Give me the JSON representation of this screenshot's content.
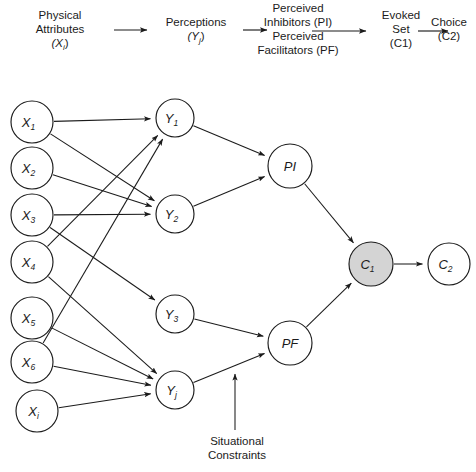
{
  "diagram": {
    "headers": [
      {
        "id": "physical-attributes",
        "line1": "Physical",
        "line2": "Attributes",
        "line3": "(X",
        "sub": "i",
        "line3_end": ")",
        "x": 12,
        "y": 8,
        "width": 96
      },
      {
        "id": "perceptions",
        "line1": "Perceptions",
        "line2": "(Y",
        "sub": "j",
        "line2_end": ")",
        "x": 152,
        "y": 15,
        "width": 88
      },
      {
        "id": "perceived-inhibitors-facilitators",
        "line1": "Perceived",
        "line2": "Inhibitors (PI)",
        "line3": "Perceived",
        "line4": "Facilitators (PF)",
        "x": 240,
        "y": 1,
        "width": 116
      },
      {
        "id": "evoked-set",
        "line1": "Evoked",
        "line2": "Set",
        "line3": "(C1)",
        "x": 372,
        "y": 8,
        "width": 58
      },
      {
        "id": "choice",
        "line1": "Choice",
        "line2": "(C2)",
        "x": 424,
        "y": 15,
        "width": 50
      }
    ],
    "header_arrows": [
      {
        "id": "arrow-attributes-to-perceptions",
        "x1": 114,
        "y1": 30,
        "x2": 147,
        "y2": 30
      },
      {
        "id": "arrow-perceptions-to-perceived",
        "x1": 243,
        "y1": 30,
        "x2": 267,
        "y2": 30
      },
      {
        "id": "arrow-perceived-to-evoked",
        "x1": 312,
        "y1": 31,
        "x2": 366,
        "y2": 31
      },
      {
        "id": "arrow-evoked-to-choice",
        "x1": 418,
        "y1": 31,
        "x2": 448,
        "y2": 31
      }
    ],
    "nodes": [
      {
        "id": "x1",
        "label": "X",
        "sub": "1",
        "cx": 32,
        "cy": 122,
        "r": 21,
        "shaded": false
      },
      {
        "id": "x2",
        "label": "X",
        "sub": "2",
        "cx": 32,
        "cy": 168,
        "r": 21,
        "shaded": false
      },
      {
        "id": "x3",
        "label": "X",
        "sub": "3",
        "cx": 32,
        "cy": 215,
        "r": 21,
        "shaded": false
      },
      {
        "id": "x4",
        "label": "X",
        "sub": "4",
        "cx": 32,
        "cy": 262,
        "r": 21,
        "shaded": false
      },
      {
        "id": "x5",
        "label": "X",
        "sub": "5",
        "cx": 32,
        "cy": 318,
        "r": 21,
        "shaded": false
      },
      {
        "id": "x6",
        "label": "X",
        "sub": "6",
        "cx": 32,
        "cy": 362,
        "r": 21,
        "shaded": false
      },
      {
        "id": "xi",
        "label": "X",
        "sub": "i",
        "cx": 37,
        "cy": 411,
        "r": 21,
        "shaded": false
      },
      {
        "id": "y1",
        "label": "Y",
        "sub": "1",
        "cx": 175,
        "cy": 118,
        "r": 19,
        "shaded": false
      },
      {
        "id": "y2",
        "label": "Y",
        "sub": "2",
        "cx": 175,
        "cy": 214,
        "r": 19,
        "shaded": false
      },
      {
        "id": "y3",
        "label": "Y",
        "sub": "3",
        "cx": 175,
        "cy": 314,
        "r": 19,
        "shaded": false
      },
      {
        "id": "yj",
        "label": "Y",
        "sub": "j",
        "cx": 175,
        "cy": 390,
        "r": 19,
        "shaded": false
      },
      {
        "id": "pi",
        "label": "PI",
        "sub": "",
        "cx": 290,
        "cy": 166,
        "r": 22,
        "shaded": false
      },
      {
        "id": "pf",
        "label": "PF",
        "sub": "",
        "cx": 290,
        "cy": 343,
        "r": 22,
        "shaded": false
      },
      {
        "id": "c1",
        "label": "C",
        "sub": "1",
        "cx": 371,
        "cy": 264,
        "r": 22,
        "shaded": true
      },
      {
        "id": "c2",
        "label": "C",
        "sub": "2",
        "cx": 449,
        "cy": 264,
        "r": 21,
        "shaded": false
      }
    ],
    "edges": [
      {
        "id": "edge-x1-y1",
        "from": "x1",
        "to": "y1"
      },
      {
        "id": "edge-x1-y2",
        "from": "x1",
        "to": "y2"
      },
      {
        "id": "edge-x2-y2",
        "from": "x2",
        "to": "y2"
      },
      {
        "id": "edge-x3-y2",
        "from": "x3",
        "to": "y2"
      },
      {
        "id": "edge-x3-y3",
        "from": "x3",
        "to": "y3"
      },
      {
        "id": "edge-x4-y1",
        "from": "x4",
        "to": "y1"
      },
      {
        "id": "edge-x4-yj",
        "from": "x4",
        "to": "yj"
      },
      {
        "id": "edge-x5-yj",
        "from": "x5",
        "to": "yj"
      },
      {
        "id": "edge-x6-y1",
        "from": "x6",
        "to": "y1"
      },
      {
        "id": "edge-x6-yj",
        "from": "x6",
        "to": "yj"
      },
      {
        "id": "edge-xi-yj",
        "from": "xi",
        "to": "yj"
      },
      {
        "id": "edge-y1-pi",
        "from": "y1",
        "to": "pi"
      },
      {
        "id": "edge-y2-pi",
        "from": "y2",
        "to": "pi"
      },
      {
        "id": "edge-y3-pf",
        "from": "y3",
        "to": "pf"
      },
      {
        "id": "edge-yj-pf",
        "from": "yj",
        "to": "pf"
      },
      {
        "id": "edge-pi-c1",
        "from": "pi",
        "to": "c1"
      },
      {
        "id": "edge-pf-c1",
        "from": "pf",
        "to": "c1"
      },
      {
        "id": "edge-c1-c2",
        "from": "c1",
        "to": "c2"
      }
    ],
    "annotation": {
      "id": "situational-constraints",
      "line1": "Situational",
      "line2": "Constraints",
      "x": 196,
      "y": 434,
      "arrow": {
        "x1": 235,
        "y1": 430,
        "x2": 235,
        "y2": 374
      }
    },
    "colors": {
      "stroke": "#1b1b1b",
      "node_fill": "#ffffff",
      "shaded_fill": "#d4d4d4",
      "background": "#ffffff"
    }
  }
}
